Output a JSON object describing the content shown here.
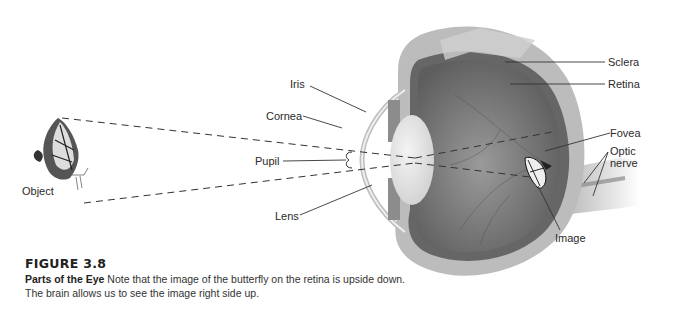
{
  "figure": {
    "number": "FIGURE 3.8",
    "title": "Parts of the Eye",
    "caption": "Note that the image of the butterfly on the retina is upside down. The brain allows us to see the image right side up."
  },
  "labels": {
    "object": "Object",
    "iris": "Iris",
    "cornea": "Cornea",
    "pupil": "Pupil",
    "lens": "Lens",
    "sclera": "Sclera",
    "retina": "Retina",
    "fovea": "Fovea",
    "optic_nerve_line1": "Optic",
    "optic_nerve_line2": "nerve",
    "image": "Image"
  },
  "colors": {
    "eye_interior": "#7a7a7a",
    "sclera": "#b8b8b8",
    "retina": "#6a6a6a",
    "lens": "#e6e6e6",
    "line": "#333333"
  }
}
